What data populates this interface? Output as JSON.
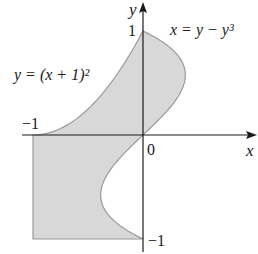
{
  "figure": {
    "axes": {
      "x_label": "x",
      "y_label": "y",
      "origin_label": "0",
      "tick_labels": {
        "x_neg1": "−1",
        "y_pos1": "1",
        "y_neg1": "−1"
      }
    },
    "curves": {
      "parabola_label": "y = (x + 1)²",
      "parabola_equation": "y = (x + 1)^2",
      "cubic_label": "x = y − y³",
      "cubic_equation": "x = y - y^3"
    },
    "region": {
      "description": "Shaded region bounded by y=(x+1)^2, x=y-y^3, y=-1 and x=-1",
      "fill_color": "#d8d8d8",
      "stroke_color": "#9a9a9a"
    },
    "colors": {
      "axis": "#1a1a1a",
      "text": "#1a1a1a",
      "background": "#ffffff"
    }
  }
}
